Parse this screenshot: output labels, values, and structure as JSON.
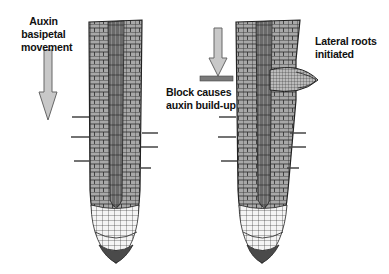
{
  "diagram": {
    "left_panel": {
      "label_line1": "Auxin basipetal",
      "label_line2": "movement",
      "arrow": "down-arrow"
    },
    "right_panel": {
      "block_label_line1": "Block causes",
      "block_label_line2": "auxin build-up",
      "lateral_label_line1": "Lateral roots",
      "lateral_label_line2": "initiated",
      "arrow": "down-arrow",
      "block": "block-bar"
    },
    "colors": {
      "cell_fill": "#a9a9a9",
      "cell_line": "#222222",
      "arrow_fill": "#c8c8c8",
      "block_fill": "#7a7a7a",
      "root_cap": "#4a4a4a"
    }
  }
}
